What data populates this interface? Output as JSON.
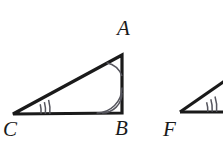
{
  "figure": {
    "type": "geometry-diagram",
    "background_color": "#ffffff",
    "stroke_color": "#1a1a1a",
    "arc_color": "#4a4a52",
    "width": 223,
    "height": 145,
    "shapes": [
      {
        "name": "triangle-abc",
        "kind": "triangle",
        "vertices": [
          {
            "label": "A",
            "x": 122,
            "y": 55
          },
          {
            "label": "B",
            "x": 122,
            "y": 113
          },
          {
            "label": "C",
            "x": 13,
            "y": 114
          }
        ],
        "stroke_width": 3.2
      },
      {
        "name": "triangle-def-partial",
        "kind": "triangle-partial",
        "vertices": [
          {
            "label": "F",
            "x": 180,
            "y": 112
          },
          {
            "label": "",
            "x": 223,
            "y": 112
          },
          {
            "label": "",
            "x": 223,
            "y": 82
          }
        ],
        "stroke_width": 3.2
      }
    ],
    "angle_marks": [
      {
        "name": "angle-a",
        "vertex": "A",
        "arcs": 1,
        "style": "single-arc"
      },
      {
        "name": "angle-b",
        "vertex": "B",
        "arcs": 2,
        "style": "double-arc"
      },
      {
        "name": "angle-c",
        "vertex": "C",
        "arcs": 3,
        "style": "triple-tick-arc"
      },
      {
        "name": "angle-f",
        "vertex": "F",
        "arcs": 3,
        "style": "triple-tick-arc"
      }
    ],
    "labels": [
      {
        "name": "label-a",
        "text": "A",
        "x": 117,
        "y": 18
      },
      {
        "name": "label-b",
        "text": "B",
        "x": 115,
        "y": 118
      },
      {
        "name": "label-c",
        "text": "C",
        "x": 3,
        "y": 119
      },
      {
        "name": "label-f",
        "text": "F",
        "x": 163,
        "y": 119
      }
    ]
  }
}
